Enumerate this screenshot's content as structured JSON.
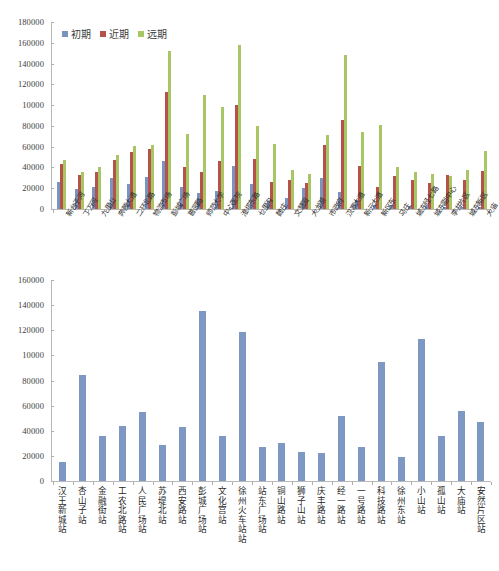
{
  "chart_data": [
    {
      "id": "top",
      "type": "bar",
      "title": "",
      "xlabel": "",
      "ylabel": "",
      "ylim": [
        0,
        180000
      ],
      "ytick_labels": [
        "0",
        "20000",
        "40000",
        "60000",
        "80000",
        "10000",
        "120000",
        "140000",
        "160000",
        "180000"
      ],
      "ytick_values": [
        0,
        20000,
        40000,
        60000,
        80000,
        100000,
        120000,
        140000,
        160000,
        180000
      ],
      "grid": false,
      "legend_position": "top-left",
      "colors": {
        "初期": "#7a94c0",
        "近期": "#b5534a",
        "远期": "#a8c764"
      },
      "categories": [
        "新台子河",
        "丁万河",
        "九里山",
        "奔腾大道",
        "二环北路",
        "物流市场",
        "彭城广场",
        "蔷园路",
        "师范大学",
        "中心医院",
        "淮塔东路",
        "七里沟",
        "魏庄",
        "文慧园",
        "大龙湖",
        "市政府",
        "汉寨大道",
        "新元大道",
        "新区东",
        "马庄",
        "城东经七路",
        "城东副中心",
        "李井片区",
        "城东新区",
        "大庙"
      ],
      "series": [
        {
          "name": "初期",
          "color": "#7a94c0",
          "values": [
            26000,
            19500,
            21000,
            30000,
            24000,
            31000,
            46000,
            21000,
            15500,
            17500,
            41000,
            24000,
            8000,
            11000,
            20000,
            30000,
            16500,
            9000,
            4000,
            3500,
            3000,
            2500,
            2000,
            2000,
            2000
          ]
        },
        {
          "name": "近期",
          "color": "#b5534a",
          "values": [
            43000,
            32500,
            35500,
            47500,
            55000,
            58000,
            113000,
            40000,
            36000,
            46000,
            100000,
            48000,
            26000,
            28000,
            25500,
            62000,
            86000,
            41000,
            21000,
            32000,
            28000,
            25500,
            33000,
            28000,
            36500
          ]
        },
        {
          "name": "远期",
          "color": "#a8c764",
          "values": [
            47000,
            36000,
            40000,
            52000,
            61000,
            62000,
            152000,
            72000,
            110000,
            98000,
            158000,
            80000,
            63000,
            38000,
            34000,
            71000,
            148000,
            74000,
            81000,
            40000,
            35500,
            34000,
            32000,
            38000,
            56000
          ]
        }
      ]
    },
    {
      "id": "bottom",
      "type": "bar",
      "title": "",
      "xlabel": "",
      "ylabel": "",
      "ylim": [
        0,
        160000
      ],
      "ytick_labels": [
        "0",
        "20000",
        "40000",
        "60000",
        "80000",
        "10000",
        "120000",
        "140000",
        "160000"
      ],
      "ytick_values": [
        0,
        20000,
        40000,
        60000,
        80000,
        100000,
        120000,
        140000,
        160000
      ],
      "grid": false,
      "legend_position": "none",
      "color": "#7e98c4",
      "categories": [
        "汉王新城站",
        "杏山子站",
        "金融街站",
        "工农北路站",
        "人民广场站",
        "苏堤北站",
        "西安路站",
        "彭城广场站",
        "文化宫站",
        "徐州火车站站",
        "站东广场站",
        "铜山路站",
        "狮子山站",
        "庆丰路站",
        "经一路站",
        "一号路站",
        "科技路站",
        "徐州东站",
        "小山站",
        "孤山站",
        "大庙站",
        "安然片区站"
      ],
      "values": [
        15000,
        84000,
        36000,
        44000,
        55000,
        29000,
        43000,
        135000,
        36000,
        119000,
        27000,
        30000,
        23000,
        22000,
        52000,
        27000,
        95000,
        19000,
        113000,
        36000,
        56000,
        47000
      ]
    }
  ]
}
